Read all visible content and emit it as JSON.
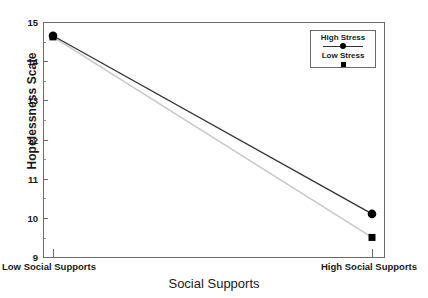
{
  "chart_data": {
    "type": "line",
    "title": "",
    "xlabel": "Social Supports",
    "ylabel": "Hopelessness Scale",
    "categories": [
      "Low Social Supports",
      "High Social Supports"
    ],
    "xtick_labels": [
      "Low Social Supports",
      "High Social Supports"
    ],
    "ytick_labels": [
      "9",
      "10",
      "11",
      "12",
      "13",
      "14",
      "15"
    ],
    "ylim": [
      9,
      15
    ],
    "yticks": [
      9,
      10,
      11,
      12,
      13,
      14,
      15
    ],
    "yminor_ticks": [
      9.5,
      10.5,
      11.5,
      12.5,
      13.5,
      14.5
    ],
    "grid": false,
    "legend_position": "top-right",
    "series": [
      {
        "name": "High Stress",
        "values": [
          14.65,
          10.1
        ],
        "marker": "circle",
        "color": "#333333"
      },
      {
        "name": "Low Stress",
        "values": [
          14.62,
          9.5
        ],
        "marker": "square",
        "color": "#c8c8c8"
      }
    ]
  },
  "legend": {
    "entries": [
      {
        "label": "High Stress",
        "marker": "circle-on-line"
      },
      {
        "label": "Low Stress",
        "marker": "square"
      }
    ]
  },
  "axes": {
    "y_title": "Hopelessness Scale",
    "x_title": "Social Supports",
    "y_labels": [
      "15",
      "14",
      "13",
      "12",
      "11",
      "10",
      "9"
    ],
    "x_labels": [
      "Low Social Supports",
      "High Social Supports"
    ]
  },
  "colors": {
    "frame": "#6a6a6a",
    "high_stress_line": "#333333",
    "low_stress_line": "#c8c8c8",
    "marker": "#000000",
    "text": "#1a1a1a",
    "background": "#ffffff"
  }
}
